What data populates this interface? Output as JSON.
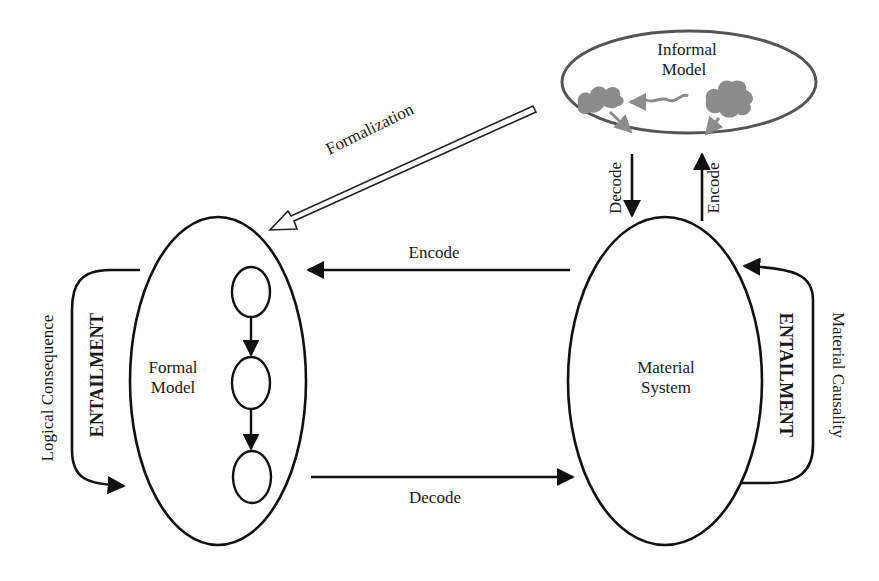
{
  "diagram": {
    "informal_model": {
      "line1": "Informal",
      "line2": "Model"
    },
    "formal_model": {
      "line1": "Formal",
      "line2": "Model"
    },
    "material_system": {
      "line1": "Material",
      "line2": "System"
    },
    "arrows": {
      "formalization": "Formalization",
      "encode_horizontal": "Encode",
      "decode_horizontal": "Decode",
      "decode_vertical": "Decode",
      "encode_vertical": "Encode"
    },
    "left_loop": {
      "outer_label": "Logical Consequence",
      "inner_label": "ENTAILMENT"
    },
    "right_loop": {
      "outer_label": "Material Causality",
      "inner_label": "ENTAILMENT"
    },
    "colors": {
      "stroke": "#111111",
      "cloud": "#8c8c8c",
      "informal_stroke": "#555555"
    }
  }
}
